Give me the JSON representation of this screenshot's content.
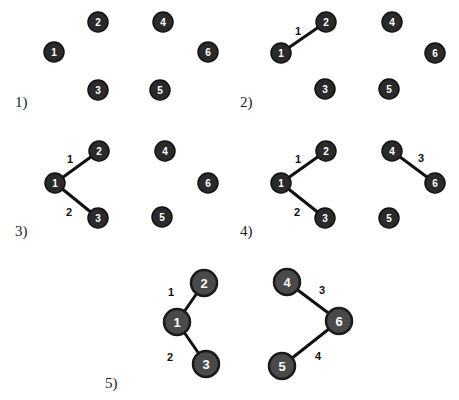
{
  "colors": {
    "node_fill": "#2a2a2a",
    "node_text": "#ffffff",
    "edge": "#111111",
    "background": "#ffffff"
  },
  "panels": [
    {
      "label": "1)",
      "label_pos": [
        15,
        107
      ],
      "radius": 10,
      "font": 10,
      "big": false,
      "nodes": [
        {
          "id": "1",
          "x": 54,
          "y": 52
        },
        {
          "id": "2",
          "x": 98,
          "y": 22
        },
        {
          "id": "3",
          "x": 98,
          "y": 90
        },
        {
          "id": "4",
          "x": 163,
          "y": 22
        },
        {
          "id": "5",
          "x": 160,
          "y": 90
        },
        {
          "id": "6",
          "x": 208,
          "y": 52
        }
      ],
      "edges": []
    },
    {
      "label": "2)",
      "label_pos": [
        240,
        107
      ],
      "radius": 10,
      "font": 10,
      "big": false,
      "nodes": [
        {
          "id": "1",
          "x": 281,
          "y": 53
        },
        {
          "id": "2",
          "x": 326,
          "y": 22
        },
        {
          "id": "3",
          "x": 325,
          "y": 89
        },
        {
          "id": "4",
          "x": 392,
          "y": 22
        },
        {
          "id": "5",
          "x": 389,
          "y": 89
        },
        {
          "id": "6",
          "x": 435,
          "y": 53
        }
      ],
      "edges": [
        {
          "from": "1",
          "to": "2",
          "weight": "1",
          "lx": 298,
          "ly": 31
        }
      ]
    },
    {
      "label": "3)",
      "label_pos": [
        15,
        236
      ],
      "radius": 10,
      "font": 10,
      "big": false,
      "nodes": [
        {
          "id": "1",
          "x": 55,
          "y": 183
        },
        {
          "id": "2",
          "x": 99,
          "y": 151
        },
        {
          "id": "3",
          "x": 98,
          "y": 218
        },
        {
          "id": "4",
          "x": 165,
          "y": 151
        },
        {
          "id": "5",
          "x": 162,
          "y": 217
        },
        {
          "id": "6",
          "x": 208,
          "y": 183
        }
      ],
      "edges": [
        {
          "from": "1",
          "to": "2",
          "weight": "1",
          "lx": 70,
          "ly": 159
        },
        {
          "from": "1",
          "to": "3",
          "weight": "2",
          "lx": 69,
          "ly": 212
        }
      ]
    },
    {
      "label": "4)",
      "label_pos": [
        240,
        236
      ],
      "radius": 10,
      "font": 10,
      "big": false,
      "nodes": [
        {
          "id": "1",
          "x": 281,
          "y": 183
        },
        {
          "id": "2",
          "x": 326,
          "y": 151
        },
        {
          "id": "3",
          "x": 325,
          "y": 218
        },
        {
          "id": "4",
          "x": 392,
          "y": 151
        },
        {
          "id": "5",
          "x": 389,
          "y": 218
        },
        {
          "id": "6",
          "x": 435,
          "y": 183
        }
      ],
      "edges": [
        {
          "from": "1",
          "to": "2",
          "weight": "1",
          "lx": 298,
          "ly": 159
        },
        {
          "from": "1",
          "to": "3",
          "weight": "2",
          "lx": 297,
          "ly": 212
        },
        {
          "from": "4",
          "to": "6",
          "weight": "3",
          "lx": 421,
          "ly": 158
        }
      ]
    },
    {
      "label": "5)",
      "label_pos": [
        105,
        388
      ],
      "radius": 13,
      "font": 13,
      "big": true,
      "nodes": [
        {
          "id": "1",
          "x": 177,
          "y": 322
        },
        {
          "id": "2",
          "x": 204,
          "y": 283
        },
        {
          "id": "3",
          "x": 206,
          "y": 364
        },
        {
          "id": "4",
          "x": 287,
          "y": 282
        },
        {
          "id": "5",
          "x": 282,
          "y": 366
        },
        {
          "id": "6",
          "x": 339,
          "y": 321
        }
      ],
      "edges": [
        {
          "from": "1",
          "to": "2",
          "weight": "1",
          "lx": 171,
          "ly": 292
        },
        {
          "from": "1",
          "to": "3",
          "weight": "2",
          "lx": 170,
          "ly": 357
        },
        {
          "from": "4",
          "to": "6",
          "weight": "3",
          "lx": 322,
          "ly": 290
        },
        {
          "from": "6",
          "to": "5",
          "weight": "4",
          "lx": 318,
          "ly": 356
        }
      ]
    }
  ]
}
